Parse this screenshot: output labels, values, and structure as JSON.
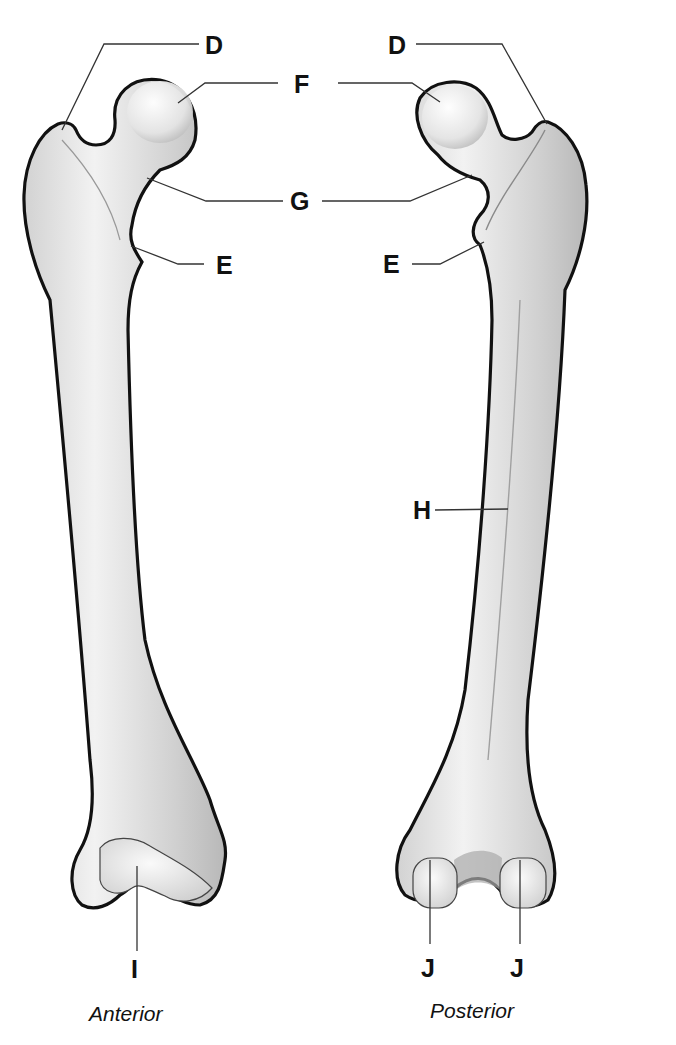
{
  "diagram": {
    "views": [
      {
        "id": "anterior",
        "caption": "Anterior"
      },
      {
        "id": "posterior",
        "caption": "Posterior"
      }
    ],
    "labels": {
      "anterior": {
        "D": "D",
        "F": "F",
        "G": "G",
        "E": "E",
        "I": "I"
      },
      "posterior": {
        "D": "D",
        "E": "E",
        "H": "H",
        "J1": "J",
        "J2": "J"
      }
    },
    "colors": {
      "bone_fill": "#e6e6e6",
      "bone_shade": "#c4c4c4",
      "outline": "#111111",
      "leader_line": "#333333",
      "background": "#ffffff"
    }
  }
}
